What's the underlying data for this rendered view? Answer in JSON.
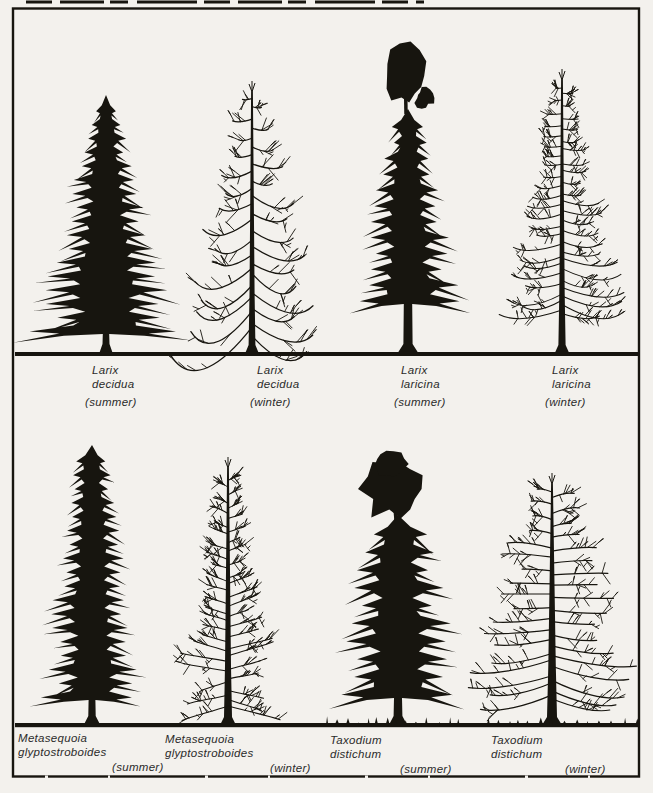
{
  "palette": {
    "paper": "#f3f1ed",
    "ink": "#17150f",
    "label_ink": "#2b2b2b"
  },
  "figure": {
    "description_rows": 2,
    "trees_per_row": 4
  },
  "trees": [
    {
      "id": "larix-decidua-summer",
      "genus": "Larix",
      "species": "decidua",
      "season": "(summer)"
    },
    {
      "id": "larix-decidua-winter",
      "genus": "Larix",
      "species": "decidua",
      "season": "(winter)"
    },
    {
      "id": "larix-laricina-summer",
      "genus": "Larix",
      "species": "laricina",
      "season": "(summer)"
    },
    {
      "id": "larix-laricina-winter",
      "genus": "Larix",
      "species": "laricina",
      "season": "(winter)"
    },
    {
      "id": "metasequoia-glyptostroboides-summer",
      "genus": "Metasequoia",
      "species": "glyptostroboides",
      "season": "(summer)"
    },
    {
      "id": "metasequoia-glyptostroboides-winter",
      "genus": "Metasequoia",
      "species": "glyptostroboides",
      "season": "(winter)"
    },
    {
      "id": "taxodium-distichum-summer",
      "genus": "Taxodium",
      "species": "distichum",
      "season": "(summer)"
    },
    {
      "id": "taxodium-distichum-winter",
      "genus": "Taxodium",
      "species": "distichum",
      "season": "(winter)"
    }
  ]
}
